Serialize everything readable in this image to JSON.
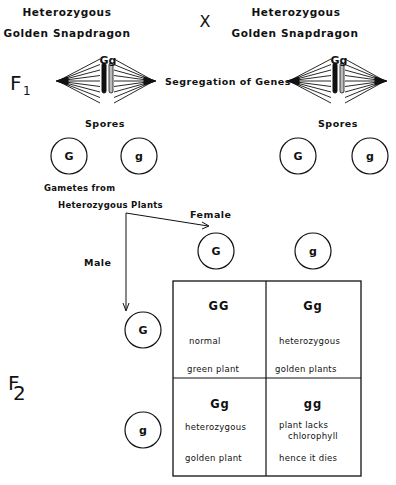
{
  "parents": {
    "left": {
      "line1": "Heterozygous",
      "line2": "Golden Snapdragon",
      "genotype": "Gg"
    },
    "right": {
      "line1": "Heterozygous",
      "line2": "Golden Snapdragon",
      "genotype": "Gg"
    },
    "cross_symbol": "X"
  },
  "generations": {
    "f1": "F",
    "f1_sub": "1",
    "f2": "F",
    "f2_sub": "2"
  },
  "segregation_label": "Segregation of Genes",
  "spores": {
    "label": "Spores",
    "left": [
      "G",
      "g"
    ],
    "right": [
      "G",
      "g"
    ]
  },
  "gametes_label": {
    "line1": "Gametes from",
    "line2": "Heterozygous Plants"
  },
  "female_label": "Female",
  "male_label": "Male",
  "female_gametes": [
    "G",
    "g"
  ],
  "male_gametes": [
    "G",
    "g"
  ],
  "punnett": [
    {
      "genotype": "GG",
      "line1": "normal",
      "line2": "",
      "line3": "green plant"
    },
    {
      "genotype": "Gg",
      "line1": "heterozygous",
      "line2": "",
      "line3": "golden plants"
    },
    {
      "genotype": "Gg",
      "line1": "heterozygous",
      "line2": "",
      "line3": "golden plant"
    },
    {
      "genotype": "gg",
      "line1": "plant lacks",
      "line2": "chlorophyll",
      "line3": "hence it dies"
    }
  ]
}
